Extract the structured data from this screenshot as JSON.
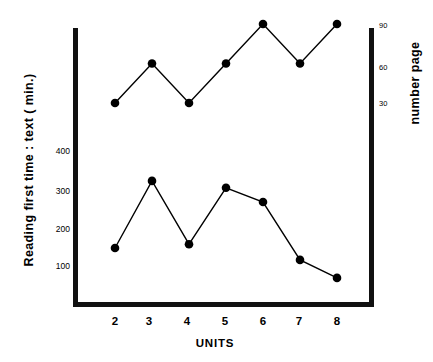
{
  "chart_data": {
    "type": "line",
    "title": "",
    "xlabel": "UNITS",
    "ylabel": "Reading first time :  text ( min.)",
    "ylabel_right": "number page",
    "categories": [
      2,
      3,
      4,
      5,
      6,
      7,
      8
    ],
    "x": [
      2,
      3,
      4,
      5,
      6,
      7,
      8
    ],
    "xlim": [
      1.4,
      8.6
    ],
    "xticks": [
      "2",
      "3",
      "4",
      "5",
      "6",
      "7",
      "8"
    ],
    "yticks_left": [
      "100",
      "200",
      "300",
      "400"
    ],
    "yticks_left_values": [
      100,
      200,
      300,
      400
    ],
    "ylim": [
      0,
      460
    ],
    "yticks_right": [
      "30",
      "60",
      "90"
    ],
    "yticks_right_values": [
      30,
      60,
      90
    ],
    "ylim_right": [
      0,
      103
    ],
    "grid": false,
    "legend": "none",
    "marker": "filled-circle",
    "series": [
      {
        "name": "number page",
        "axis": "right",
        "values": [
          30,
          60,
          30,
          60,
          90,
          60,
          90
        ],
        "color": "#000000"
      },
      {
        "name": "Reading first time : text (min.)",
        "axis": "left",
        "values": [
          147,
          322,
          157,
          304,
          267,
          116,
          69
        ],
        "color": "#000000"
      }
    ]
  },
  "axes": {
    "x_title": "UNITS",
    "y_left_title": "Reading first time :  text ( min.)",
    "y_right_title": "number page"
  }
}
